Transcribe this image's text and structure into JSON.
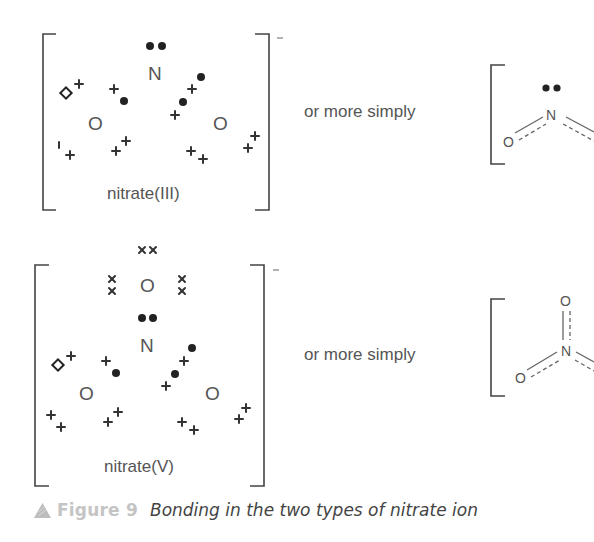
{
  "figure": {
    "number_label": "Figure 9",
    "caption": "Bonding in the two types of nitrate ion",
    "caption_icon": "triangle-icon",
    "colors": {
      "text": "#555555",
      "electrons": "#222222",
      "caption_number": "#c4c4c4",
      "caption_text": "#444444"
    }
  },
  "nitrate_iii": {
    "name": "nitrate(III)",
    "charge": "−",
    "atoms": {
      "n": "N",
      "o_left": "O",
      "o_right": "O"
    },
    "connector_text": "or more simply",
    "simple_structure": {
      "n": "N",
      "o_left": "O"
    }
  },
  "nitrate_v": {
    "name": "nitrate(V)",
    "charge": "−",
    "atoms": {
      "o_top": "O",
      "n": "N",
      "o_left": "O",
      "o_right": "O"
    },
    "connector_text": "or more simply",
    "simple_structure": {
      "o_top": "O",
      "n": "N",
      "o_left": "O"
    }
  }
}
